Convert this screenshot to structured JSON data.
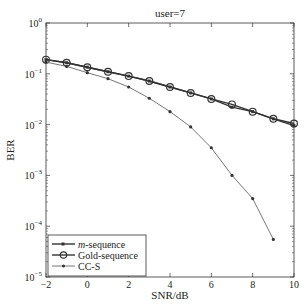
{
  "chart_data": {
    "type": "line",
    "title": "user=7",
    "xlabel": "SNR/dB",
    "ylabel": "BER",
    "xlim": [
      -2,
      10
    ],
    "ylim": [
      1e-05,
      1
    ],
    "yscale": "log",
    "grid": false,
    "legend_position": "lower left",
    "x_ticks": [
      "-2",
      "0",
      "2",
      "4",
      "6",
      "8",
      "10"
    ],
    "y_ticks": [
      "10^0",
      "10^-1",
      "10^-2",
      "10^-3",
      "10^-4",
      "10^-5"
    ],
    "series": [
      {
        "name": "m-sequence",
        "marker": "square",
        "x": [
          -2,
          -1,
          0,
          1,
          2,
          3,
          4,
          5,
          6,
          7,
          8,
          9,
          10
        ],
        "values": [
          0.19,
          0.165,
          0.135,
          0.11,
          0.09,
          0.072,
          0.055,
          0.042,
          0.032,
          0.022,
          0.018,
          0.013,
          0.0095
        ]
      },
      {
        "name": "Gold-sequence",
        "marker": "circle",
        "x": [
          -2,
          -1,
          0,
          1,
          2,
          3,
          4,
          5,
          6,
          7,
          8,
          9,
          10
        ],
        "values": [
          0.19,
          0.165,
          0.135,
          0.11,
          0.09,
          0.072,
          0.055,
          0.042,
          0.032,
          0.025,
          0.018,
          0.013,
          0.0105
        ]
      },
      {
        "name": "CC-S",
        "marker": "star",
        "x": [
          -2,
          -1,
          0,
          1,
          2,
          3,
          4,
          5,
          6,
          7,
          8,
          9
        ],
        "values": [
          0.17,
          0.14,
          0.105,
          0.08,
          0.055,
          0.033,
          0.018,
          0.009,
          0.0035,
          0.001,
          0.00035,
          5.5e-05
        ]
      }
    ]
  },
  "legend": {
    "m_prefix": "m",
    "m_suffix": "-sequence",
    "gold": "Gold-sequence",
    "ccs": "CC-S"
  }
}
